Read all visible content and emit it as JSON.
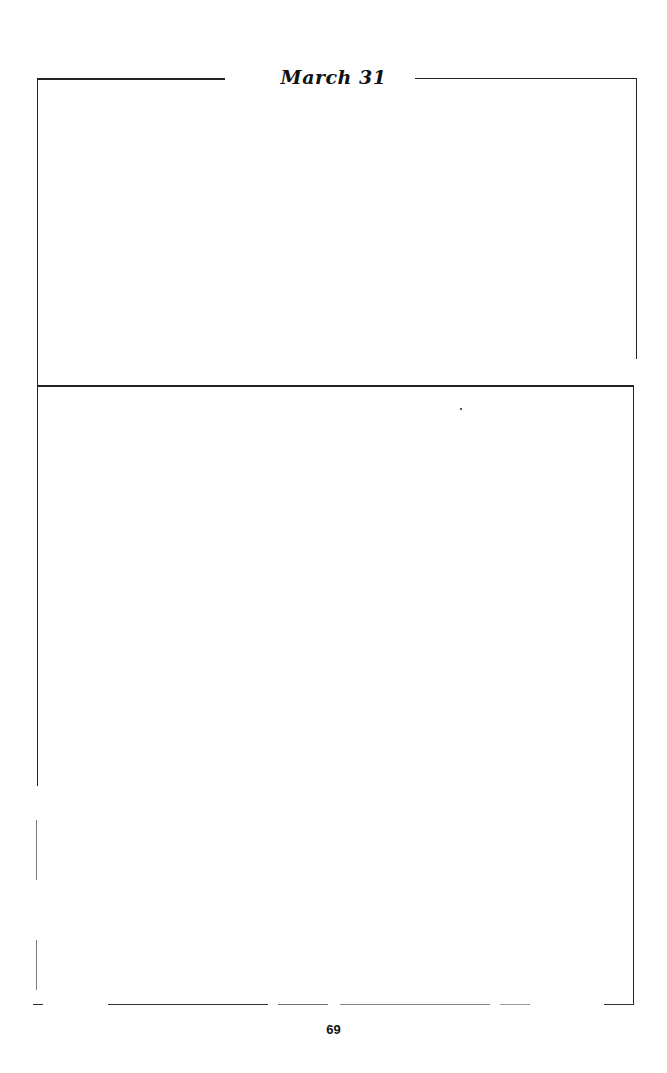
{
  "page": {
    "header_title": "March 31",
    "page_number": "69"
  }
}
